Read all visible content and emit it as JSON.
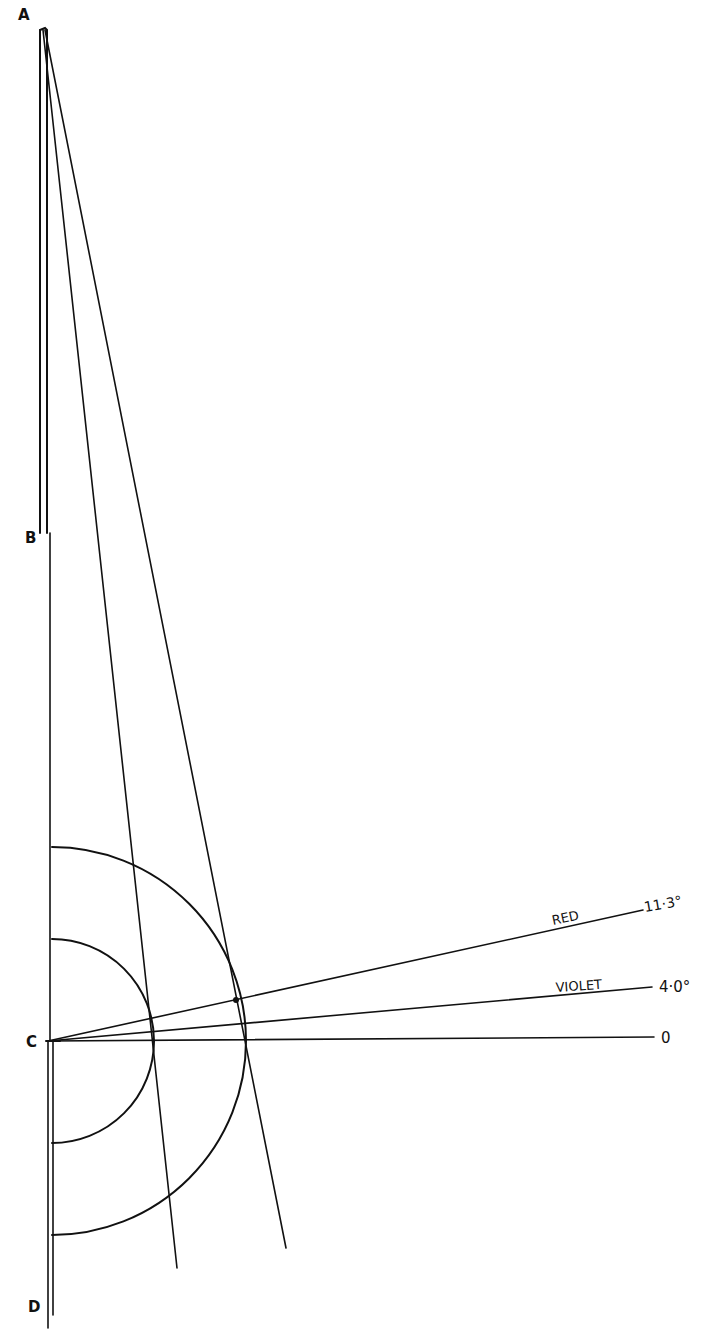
{
  "diagram": {
    "points": {
      "A": {
        "label": "A"
      },
      "B": {
        "label": "B"
      },
      "C": {
        "label": "C"
      },
      "D": {
        "label": "D"
      }
    },
    "rays": [
      {
        "name": "red",
        "label": "RED",
        "angle_label": "11·3°",
        "angle": 11.3
      },
      {
        "name": "violet",
        "label": "VIOLET",
        "angle_label": "4·0°",
        "angle": 4.0
      },
      {
        "name": "zero",
        "label": "",
        "angle_label": "0",
        "angle": 0
      }
    ],
    "arcs": [
      {
        "name": "inner-semicircle"
      },
      {
        "name": "outer-semicircle"
      }
    ],
    "stroke_color": "#111111",
    "background": "#ffffff"
  }
}
